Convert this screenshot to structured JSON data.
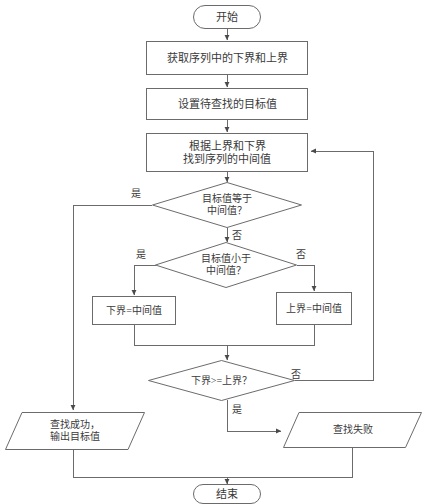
{
  "diagram": {
    "language": "zh",
    "stroke_color": "#6b6b6b",
    "text_color": "#3a3a3a",
    "background_color": "#ffffff"
  },
  "nodes": {
    "start": {
      "label": "开始",
      "shape": "terminator"
    },
    "get_bounds": {
      "label": "获取序列中的下界和上界",
      "shape": "process"
    },
    "set_target": {
      "label": "设置待查找的目标值",
      "shape": "process"
    },
    "find_mid": {
      "label": "根据上界和下界\n找到序列的中间值",
      "shape": "process"
    },
    "eq_mid": {
      "label": "目标值等于\n中间值？",
      "shape": "decision"
    },
    "lt_mid": {
      "label": "目标值小于\n中间值？",
      "shape": "decision"
    },
    "set_lower": {
      "label": "下界=中间值",
      "shape": "process"
    },
    "set_upper": {
      "label": "上界=中间值",
      "shape": "process"
    },
    "bounds_cross": {
      "label": "下界>=上界？",
      "shape": "decision"
    },
    "success": {
      "label": "查找成功，\n输出目标值",
      "shape": "io"
    },
    "failure": {
      "label": "查找失败",
      "shape": "io"
    },
    "end": {
      "label": "结束",
      "shape": "terminator"
    }
  },
  "edge_labels": {
    "eq_yes": "是",
    "eq_no": "否",
    "lt_yes": "是",
    "lt_no": "否",
    "cross_yes": "是",
    "cross_no": "否"
  }
}
